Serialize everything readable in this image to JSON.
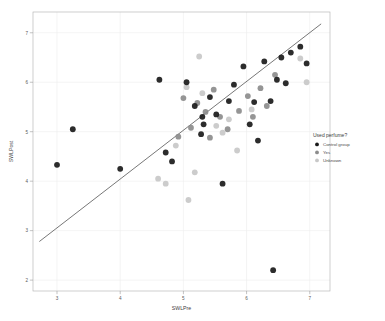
{
  "chart_data": {
    "type": "scatter",
    "title": "",
    "xlabel": "SWLPre",
    "ylabel": "SWLPost",
    "xlim": [
      2.62,
      7.32
    ],
    "ylim": [
      1.78,
      7.42
    ],
    "xticks": [
      3,
      4,
      5,
      6,
      7
    ],
    "xtick_labels": [
      "3",
      "4",
      "5",
      "6",
      "7"
    ],
    "yticks": [
      2,
      3,
      4,
      5,
      6,
      7
    ],
    "ytick_labels": [
      "2",
      "3",
      "4",
      "5",
      "6",
      "7"
    ],
    "grid": true,
    "legend_position": "right",
    "legend_title": "Used perfume?",
    "series": [
      {
        "name": "Control group",
        "color": "#1a1a1a",
        "marker": "circle",
        "points": [
          [
            3.0,
            4.33
          ],
          [
            3.25,
            5.05
          ],
          [
            4.0,
            4.25
          ],
          [
            4.62,
            6.05
          ],
          [
            5.05,
            6.0
          ],
          [
            4.72,
            4.58
          ],
          [
            4.82,
            4.4
          ],
          [
            5.18,
            5.52
          ],
          [
            5.3,
            5.3
          ],
          [
            5.32,
            5.15
          ],
          [
            5.28,
            4.95
          ],
          [
            5.52,
            5.35
          ],
          [
            5.62,
            3.95
          ],
          [
            5.72,
            5.62
          ],
          [
            5.8,
            5.95
          ],
          [
            5.42,
            5.7
          ],
          [
            6.05,
            5.15
          ],
          [
            6.18,
            4.82
          ],
          [
            6.12,
            5.6
          ],
          [
            6.28,
            6.42
          ],
          [
            6.38,
            5.62
          ],
          [
            6.48,
            6.05
          ],
          [
            6.55,
            6.5
          ],
          [
            6.7,
            6.6
          ],
          [
            6.85,
            6.72
          ],
          [
            6.95,
            6.38
          ],
          [
            6.42,
            2.2
          ],
          [
            5.95,
            6.32
          ],
          [
            6.62,
            5.98
          ]
        ]
      },
      {
        "name": "Yes",
        "color": "#8c8c8c",
        "marker": "circle",
        "points": [
          [
            5.0,
            5.68
          ],
          [
            5.22,
            5.58
          ],
          [
            5.12,
            5.08
          ],
          [
            5.35,
            5.4
          ],
          [
            5.48,
            5.85
          ],
          [
            5.58,
            5.3
          ],
          [
            5.7,
            5.05
          ],
          [
            5.88,
            5.42
          ],
          [
            6.02,
            5.72
          ],
          [
            6.1,
            5.3
          ],
          [
            6.22,
            5.88
          ],
          [
            6.32,
            5.52
          ],
          [
            5.42,
            4.88
          ],
          [
            4.92,
            4.9
          ],
          [
            6.45,
            6.15
          ]
        ]
      },
      {
        "name": "Unknown",
        "color": "#c8c8c8",
        "marker": "circle",
        "points": [
          [
            5.25,
            6.52
          ],
          [
            5.05,
            5.9
          ],
          [
            5.3,
            5.78
          ],
          [
            4.88,
            4.72
          ],
          [
            5.52,
            5.12
          ],
          [
            5.62,
            4.98
          ],
          [
            5.72,
            5.25
          ],
          [
            5.85,
            4.62
          ],
          [
            6.08,
            5.45
          ],
          [
            4.6,
            4.05
          ],
          [
            4.72,
            3.95
          ],
          [
            5.18,
            4.18
          ],
          [
            6.85,
            6.48
          ],
          [
            6.95,
            6.0
          ],
          [
            5.08,
            3.62
          ]
        ]
      }
    ],
    "fit_line": {
      "name": "regression-line",
      "x": [
        2.72,
        7.18
      ],
      "y": [
        2.78,
        7.18
      ],
      "color": "#4a4a4a"
    }
  }
}
